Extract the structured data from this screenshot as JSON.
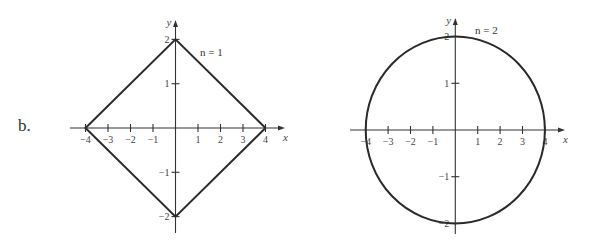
{
  "part_label": "b.",
  "chart_data": [
    {
      "type": "line",
      "title": "n = 1",
      "equation_label": "n = 1",
      "shape": "diamond |x|/4 + |y|/2 = 1",
      "xlabel": "x",
      "ylabel": "y",
      "xlim": [
        -4.5,
        4.9
      ],
      "ylim": [
        -2.4,
        2.4
      ],
      "x_ticks": [
        -4,
        -3,
        -2,
        -1,
        1,
        2,
        3,
        4
      ],
      "x_tick_labels": [
        "−4",
        "−3",
        "−2",
        "−1",
        "1",
        "2",
        "3",
        "4"
      ],
      "y_ticks": [
        -2,
        -1,
        1,
        2
      ],
      "y_tick_labels": [
        "−2",
        "−1",
        "1",
        "2"
      ],
      "grid": false,
      "series": [
        {
          "name": "n = 1",
          "x": [
            4,
            0,
            -4,
            0,
            4
          ],
          "y": [
            0,
            2,
            0,
            -2,
            0
          ]
        }
      ]
    },
    {
      "type": "line",
      "title": "n = 2",
      "equation_label": "n = 2",
      "shape": "ellipse x^2/16 + y^2/4 = 1",
      "xlabel": "x",
      "ylabel": "y",
      "xlim": [
        -4.5,
        4.9
      ],
      "ylim": [
        -2.4,
        2.4
      ],
      "x_ticks": [
        -4,
        -3,
        -2,
        -1,
        1,
        2,
        3,
        4
      ],
      "x_tick_labels": [
        "−4",
        "−3",
        "−2",
        "−1",
        "1",
        "2",
        "3",
        "4"
      ],
      "y_ticks": [
        -2,
        -1,
        1,
        2
      ],
      "y_tick_labels": [
        "−2",
        "−1",
        "1",
        "2"
      ],
      "grid": false,
      "series": [
        {
          "name": "n = 2",
          "x": [
            4,
            3.464,
            2,
            0,
            -2,
            -3.464,
            -4,
            -3.464,
            -2,
            0,
            2,
            3.464,
            4
          ],
          "y": [
            0,
            1,
            1.732,
            2,
            1.732,
            1,
            0,
            -1,
            -1.732,
            -2,
            -1.732,
            -1,
            0
          ]
        }
      ]
    }
  ]
}
